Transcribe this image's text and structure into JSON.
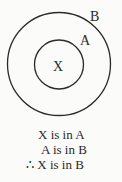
{
  "diagram": {
    "outer_set_label": "B",
    "inner_set_label": "A",
    "element_label": "X"
  },
  "statements": [
    "X is in A",
    "A is in B",
    "∴ X is in B"
  ],
  "colors": {
    "stroke": "#2a2a2a",
    "background": "#fbfbfa"
  }
}
